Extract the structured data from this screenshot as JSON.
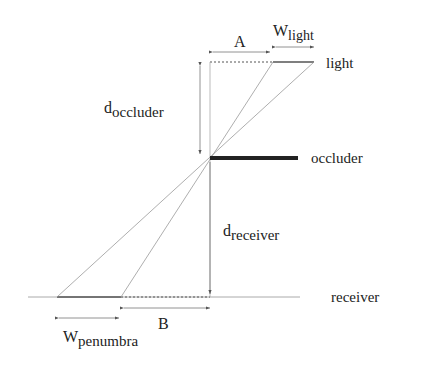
{
  "diagram": {
    "labels": {
      "light": "light",
      "occluder": "occluder",
      "receiver": "receiver",
      "A": "A",
      "B": "B",
      "w_light_main": "W",
      "w_light_sub": "light",
      "d_occluder_main": "d",
      "d_occluder_sub": "occluder",
      "d_receiver_main": "d",
      "d_receiver_sub": "receiver",
      "w_penumbra_main": "W",
      "w_penumbra_sub": "penumbra"
    },
    "colors": {
      "line": "#888888",
      "occluder": "#222222",
      "text": "#222222"
    }
  }
}
